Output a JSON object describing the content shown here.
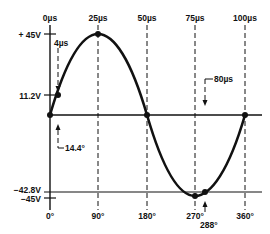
{
  "diagram": {
    "type": "sine-wave-timing",
    "time_labels": [
      "0µs",
      "25µs",
      "50µs",
      "75µs",
      "100µs"
    ],
    "angle_labels": [
      "0°",
      "90°",
      "180°",
      "270°",
      "360°"
    ],
    "voltage_labels": {
      "pos_peak": "+ 45V",
      "point_a": "11.2V",
      "point_b": "−42.8V",
      "neg_peak": "−45V"
    },
    "annotations": {
      "t4": "4µs",
      "t80": "80µs",
      "angle_a": "14.4°",
      "angle_b": "288°"
    },
    "colors": {
      "ink": "#111111",
      "background": "#ffffff"
    }
  }
}
